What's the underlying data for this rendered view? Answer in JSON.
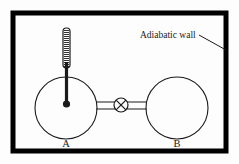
{
  "figure": {
    "background_color": "#fdfdfd",
    "ink_color": "#1a1a1a",
    "outer_frame": {
      "name": "adiabatic wall",
      "stroke_color": "#000000",
      "stroke_width": 5,
      "x": 13,
      "y": 13,
      "width": 213,
      "height": 138
    },
    "annotation": {
      "label": "Adiabatic wall",
      "font_size": 9.5,
      "text_x": 140,
      "text_y": 38,
      "leader_from_x": 199,
      "leader_from_y": 35,
      "leader_to_x": 226,
      "leader_to_y": 50
    },
    "vessels": [
      {
        "label": "A",
        "cx": 66,
        "cy": 108,
        "r": 31,
        "label_x": 66,
        "label_y": 147,
        "stroke_width": 1.1
      },
      {
        "label": "B",
        "cx": 177,
        "cy": 108,
        "r": 31,
        "label_x": 177,
        "label_y": 147,
        "stroke_width": 1.1
      }
    ],
    "pipe": {
      "name": "connecting tube",
      "left_x": 96,
      "right_x": 147,
      "top_y": 102,
      "bottom_y": 109,
      "stroke_width": 1.1
    },
    "valve": {
      "name": "valve",
      "symbol": "circle-with-cross",
      "cx": 121,
      "cy": 105,
      "r": 7,
      "stroke_width": 1.2
    },
    "thermometer": {
      "name": "thermometer",
      "tube_x": 63,
      "tube_y": 28,
      "tube_width": 7,
      "tube_height": 40,
      "graduation_count": 19,
      "stem_x": 66.5,
      "stem_top_y": 64,
      "stem_bottom_y": 103,
      "stem_width": 3.2,
      "bulb_cx": 66.5,
      "bulb_cy": 104,
      "bulb_r": 3.6
    }
  }
}
